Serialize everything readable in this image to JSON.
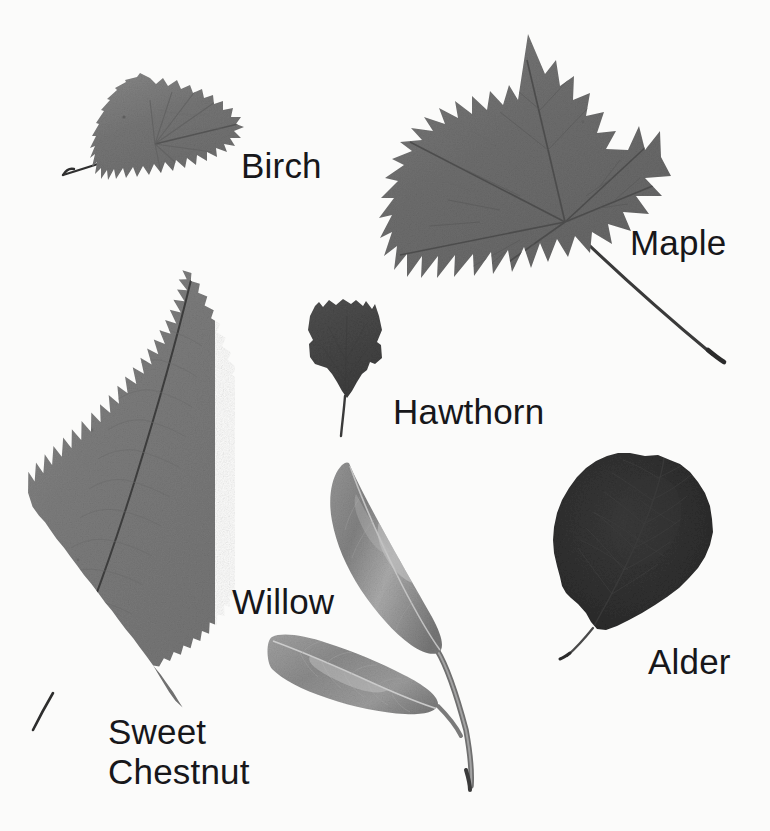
{
  "plate": {
    "kind": "photographic-leaf-identification-plate",
    "background_color": "#fbfbfa",
    "label_color": "#17171a",
    "width": 770,
    "height": 831
  },
  "specimens": [
    {
      "id": "birch",
      "label": "Birch",
      "leaf_shape": "triangular-deltoid, doubly serrate margin, pointed apex, long slender petiole to the left",
      "tone": "#787878",
      "bounds": {
        "x": 62,
        "y": 76,
        "w": 186,
        "h": 126
      },
      "label_position": {
        "x": 241,
        "y": 146
      }
    },
    {
      "id": "maple",
      "label": "Maple",
      "leaf_shape": "five-lobed palmate maple leaf with deep sinuses and pointed teeth, long straight petiole running down to the right",
      "tone": "#6f6f6f",
      "bounds": {
        "x": 390,
        "y": 34,
        "w": 280,
        "h": 290
      },
      "label_position": {
        "x": 630,
        "y": 223
      }
    },
    {
      "id": "hawthorn",
      "label": "Hawthorn",
      "leaf_shape": "small dark obovate leaf with five rounded lobes, wedge-shaped base, short petiole",
      "tone": "#4a4a4a",
      "bounds": {
        "x": 307,
        "y": 299,
        "w": 76,
        "h": 100
      },
      "label_position": {
        "x": 393,
        "y": 392
      }
    },
    {
      "id": "sweet-chestnut",
      "label": "Sweet\nChestnut",
      "label_lines": [
        "Sweet",
        "Chestnut"
      ],
      "leaf_shape": "very long lanceolate leaf, coarse bristle-tipped serrations, prominent midrib and parallel lateral veins, tilted with the tip upper-right",
      "tone": "#7d7d7d",
      "bounds": {
        "x": 27,
        "y": 273,
        "w": 175,
        "h": 437
      },
      "label_position": {
        "x": 108,
        "y": 712
      }
    },
    {
      "id": "willow",
      "label": "Willow",
      "leaf_shape": "twig bearing two narrow lanceolate leaves with silvery sheen on a shared stem running to lower right",
      "tone": "#8a8a8a",
      "bounds": {
        "x": 270,
        "y": 461,
        "w": 205,
        "h": 330
      },
      "label_position": {
        "x": 232,
        "y": 582
      }
    },
    {
      "id": "alder",
      "label": "Alder",
      "leaf_shape": "almost circular dark leaf with slightly notched apex and wavy toothed margin, thin petiole to the lower left",
      "tone": "#303030",
      "bounds": {
        "x": 553,
        "y": 453,
        "w": 160,
        "h": 180
      },
      "label_position": {
        "x": 648,
        "y": 642
      }
    }
  ]
}
